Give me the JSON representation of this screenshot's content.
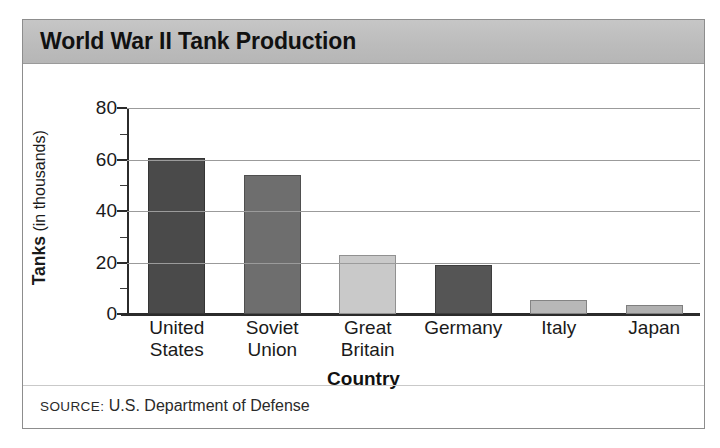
{
  "figure": {
    "title": "World War II Tank Production",
    "source_keyword": "SOURCE:",
    "source_text": "U.S. Department of Defense"
  },
  "axis": {
    "y_title_strong": "Tanks",
    "y_title_light": " (in thousands)",
    "x_title": "Country"
  },
  "colors": {
    "title_band": "#bcbcbc",
    "frame": "#8d8d8d",
    "gridline": "#9b9b9b",
    "axis": "#2b2b2b",
    "bar_dark": "#4a4a4a",
    "bar_medium": "#6e6e6e",
    "bar_light": "#c9c9c9",
    "bar_mid_light": "#b0b0b0"
  },
  "chart_data": {
    "type": "bar",
    "title": "World War II Tank Production",
    "xlabel": "Country",
    "ylabel": "Tanks (in thousands)",
    "categories": [
      "United\nStates",
      "Soviet\nUnion",
      "Great\nBritain",
      "Germany",
      "Italy",
      "Japan"
    ],
    "values": [
      60.5,
      54,
      23,
      19,
      5.5,
      3.5
    ],
    "bar_colors": [
      "#4a4a4a",
      "#6e6e6e",
      "#c9c9c9",
      "#555555",
      "#b8b8b8",
      "#b0b0b0"
    ],
    "ylim": [
      0,
      80
    ],
    "yticks": [
      0,
      20,
      40,
      60,
      80
    ],
    "ytick_labels": [
      "0",
      "20",
      "40",
      "60",
      "80"
    ],
    "yminor_step": 10,
    "grid": true,
    "legend": "none",
    "units": "thousands of tanks"
  }
}
